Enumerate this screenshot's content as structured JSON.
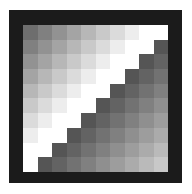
{
  "figure": {
    "rows": 10,
    "cols": 10,
    "frame_color": "#1b1b1b",
    "background": "#ffffff",
    "upper_region": {
      "start_gray": 110,
      "end_gray": 255,
      "white_from_sum": 8
    },
    "lower_region": {
      "start_gray": 85,
      "end_gray": 200,
      "diagonal_sum": 10,
      "max_sum": 18
    }
  }
}
